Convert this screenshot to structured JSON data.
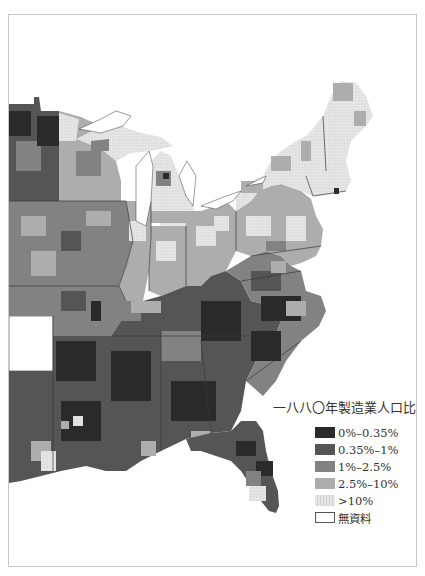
{
  "map": {
    "type": "choropleth",
    "region": "Eastern United States (county level)",
    "colors": {
      "class0": "#2a2a2a",
      "class1": "#555555",
      "class2": "#828282",
      "class3": "#adadad",
      "class4": "#e2e2e2",
      "nodata": "#ffffff",
      "border": "#3a3a3a",
      "frame": "#c8c8c8"
    }
  },
  "legend": {
    "title": "一八八〇年製造業人口比例",
    "items": [
      {
        "label": "0%–0.35%",
        "color": "#2a2a2a",
        "icon": "swatch-darkest"
      },
      {
        "label": "0.35%–1%",
        "color": "#555555",
        "icon": "swatch-dark"
      },
      {
        "label": "1%–2.5%",
        "color": "#828282",
        "icon": "swatch-medium"
      },
      {
        "label": "2.5%–10%",
        "color": "#adadad",
        "icon": "swatch-light"
      },
      {
        "label": ">10%",
        "color": "#e2e2e2",
        "icon": "swatch-lightest-dotted"
      },
      {
        "label": "無資料",
        "color": "#ffffff",
        "icon": "swatch-empty"
      }
    ]
  }
}
